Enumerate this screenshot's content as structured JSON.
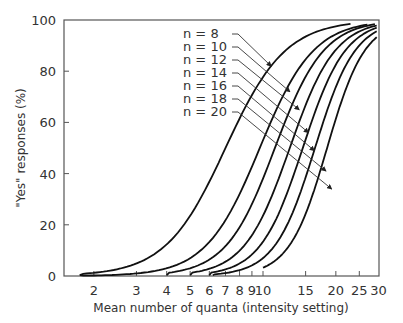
{
  "chart_data": {
    "type": "line",
    "title": "",
    "xlabel": "Mean number of quanta (intensity setting)",
    "ylabel": "\"Yes\" responses (%)",
    "xscale": "log",
    "xlim": [
      1,
      30
    ],
    "ylim": [
      0,
      100
    ],
    "x_ticks": [
      2,
      3,
      4,
      5,
      6,
      7,
      8,
      9,
      10,
      15,
      20,
      25,
      30
    ],
    "y_ticks": [
      0,
      20,
      40,
      60,
      80,
      100
    ],
    "grid": false,
    "legend_position": "upper-left-inside, with leader arrows to curves",
    "series": [
      {
        "name": "n = 8",
        "n": 8,
        "x50": 7.0,
        "slope": 0.124,
        "x_start": 1.75,
        "x_end": 23.0,
        "points": [
          [
            1.8,
            0
          ],
          [
            2.9,
            4.4
          ],
          [
            3.9,
            11
          ],
          [
            5.0,
            24
          ],
          [
            7.0,
            50
          ],
          [
            8.8,
            69
          ],
          [
            10.8,
            82
          ],
          [
            14.2,
            95
          ],
          [
            23.0,
            99.5
          ]
        ]
      },
      {
        "name": "n = 10",
        "n": 10,
        "x50": 9.7,
        "slope": 0.111,
        "x_start": 1.75,
        "x_end": 27.0,
        "points": [
          [
            1.8,
            0
          ],
          [
            3.0,
            1
          ],
          [
            4.0,
            4
          ],
          [
            5.0,
            9
          ],
          [
            7.0,
            25
          ],
          [
            9.7,
            50
          ],
          [
            12.0,
            70
          ],
          [
            15.0,
            86
          ],
          [
            27.0,
            99
          ]
        ]
      },
      {
        "name": "n = 12",
        "n": 12,
        "x50": 11.2,
        "slope": 0.101,
        "x_start": 4.0,
        "x_end": 29.0,
        "points": [
          [
            4.0,
            0
          ],
          [
            5.0,
            3.5
          ],
          [
            7.0,
            12
          ],
          [
            9.0,
            29
          ],
          [
            11.2,
            50
          ],
          [
            14.0,
            72
          ],
          [
            18.0,
            89
          ],
          [
            29.0,
            99
          ]
        ]
      },
      {
        "name": "n = 14",
        "n": 14,
        "x50": 12.9,
        "slope": 0.094,
        "x_start": 5.0,
        "x_end": 29.5,
        "points": [
          [
            5.0,
            0
          ],
          [
            6.0,
            2
          ],
          [
            8.0,
            9
          ],
          [
            10.0,
            24
          ],
          [
            12.9,
            50
          ],
          [
            16.0,
            74
          ],
          [
            20.0,
            89
          ],
          [
            29.5,
            98
          ]
        ]
      },
      {
        "name": "n = 16",
        "n": 16,
        "x50": 14.6,
        "slope": 0.088,
        "x_start": 6.0,
        "x_end": 29.5,
        "points": [
          [
            6.0,
            0
          ],
          [
            7.0,
            1.5
          ],
          [
            9.0,
            8
          ],
          [
            12.0,
            28
          ],
          [
            14.6,
            50
          ],
          [
            18.0,
            74
          ],
          [
            22.0,
            88
          ],
          [
            29.5,
            96
          ]
        ]
      },
      {
        "name": "n = 18",
        "n": 18,
        "x50": 16.4,
        "slope": 0.083,
        "x_start": 6.2,
        "x_end": 29.5,
        "points": [
          [
            6.2,
            0
          ],
          [
            8.0,
            2
          ],
          [
            10.0,
            7
          ],
          [
            13.0,
            24
          ],
          [
            16.4,
            50
          ],
          [
            20.0,
            73
          ],
          [
            25.0,
            88
          ],
          [
            29.5,
            93
          ]
        ]
      },
      {
        "name": "n = 20",
        "n": 20,
        "x50": 18.4,
        "slope": 0.078,
        "x_start": 10.0,
        "x_end": 29.5,
        "points": [
          [
            10.0,
            5.5
          ],
          [
            12.0,
            12
          ],
          [
            15.0,
            29
          ],
          [
            18.4,
            50
          ],
          [
            22.0,
            70
          ],
          [
            26.0,
            84
          ],
          [
            29.5,
            90
          ]
        ]
      }
    ],
    "legend_arrow_targets_pct": [
      [
        10.8,
        82
      ],
      [
        12.9,
        72
      ],
      [
        14.1,
        65
      ],
      [
        15.4,
        56
      ],
      [
        16.3,
        49
      ],
      [
        18.2,
        41
      ],
      [
        19.2,
        34
      ]
    ]
  },
  "labels": {
    "y_axis_title": "\"Yes\" responses (%)",
    "x_axis_title": "Mean number of quanta (intensity setting)",
    "y_tick_labels": [
      "0",
      "20",
      "40",
      "60",
      "80",
      "100"
    ],
    "x_tick_labels": [
      "2",
      "3",
      "4",
      "5",
      "6",
      "7",
      "8",
      "9",
      "10",
      "15",
      "20",
      "25",
      "30"
    ],
    "legend": [
      "n =  8",
      "n = 10",
      "n = 12",
      "n = 14",
      "n = 16",
      "n = 18",
      "n = 20"
    ]
  }
}
